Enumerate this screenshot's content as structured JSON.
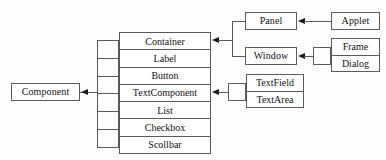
{
  "diagram": {
    "type": "class-hierarchy",
    "stroke_color": "#5a5a5a",
    "arrow_color": "#1a1a1a",
    "background_color": "#fdfdfb",
    "root": {
      "label": "Component"
    },
    "component_subclasses": [
      {
        "label": "Container"
      },
      {
        "label": "Label"
      },
      {
        "label": "Button"
      },
      {
        "label": "TextComponent"
      },
      {
        "label": "List"
      },
      {
        "label": "Checkbox"
      },
      {
        "label": "Scollbar"
      }
    ],
    "container_subclasses": [
      {
        "label": "Panel"
      },
      {
        "label": "Window"
      }
    ],
    "panel_subclasses": [
      {
        "label": "Applet"
      }
    ],
    "window_subclasses": [
      {
        "label": "Frame"
      },
      {
        "label": "Dialog"
      }
    ],
    "textcomponent_subclasses": [
      {
        "label": "TextField"
      },
      {
        "label": "TextArea"
      }
    ]
  }
}
